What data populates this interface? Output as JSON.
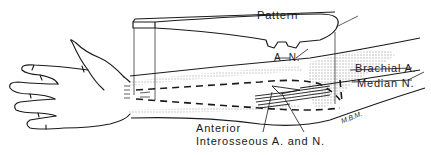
{
  "diagram": {
    "type": "anatomical line drawing",
    "labels": {
      "pattern": "Pattern",
      "pattern_notch": "A. N.",
      "brachial_artery": "Brachial A.",
      "median_nerve": "Median N.",
      "anterior_line1": "Anterior",
      "anterior_line2": "Interosseous A. and N.",
      "signature": "M.B.M."
    },
    "colors": {
      "ink": "#1a1a1a",
      "shading": "#c8c8c8",
      "background": "#ffffff"
    }
  }
}
